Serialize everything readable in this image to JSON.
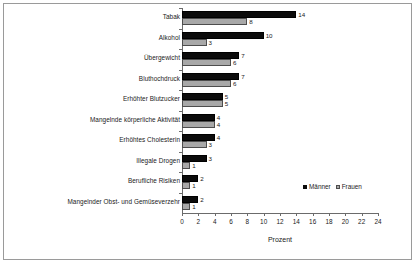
{
  "chart_data": {
    "type": "bar",
    "orientation": "horizontal",
    "title": "",
    "xlabel": "Prozent",
    "ylabel": "",
    "xlim": [
      0,
      24
    ],
    "xticks": [
      0,
      2,
      4,
      6,
      8,
      10,
      12,
      14,
      16,
      18,
      20,
      22,
      24
    ],
    "grid": false,
    "legend_position": "inside-right-lower",
    "categories": [
      "Tabak",
      "Alkohol",
      "Übergewicht",
      "Bluthochdruck",
      "Erhöhter Blutzucker",
      "Mangelnde körperliche Aktivität",
      "Erhöhtes Cholesterin",
      "Illegale Drogen",
      "Berufliche Risiken",
      "Mangelnder Obst- und Gemüseverzehr"
    ],
    "series": [
      {
        "name": "Männer",
        "color": "#0b0b0b",
        "values": [
          14,
          10,
          7,
          7,
          5,
          4,
          4,
          3,
          2,
          2
        ]
      },
      {
        "name": "Frauen",
        "color": "#a8a8a8",
        "values": [
          8,
          3,
          6,
          6,
          5,
          4,
          3,
          1,
          1,
          1
        ]
      }
    ]
  },
  "legend": {
    "entries": [
      {
        "label": "Männer"
      },
      {
        "label": "Frauen"
      }
    ]
  },
  "axis": {
    "x_title": "Prozent"
  }
}
